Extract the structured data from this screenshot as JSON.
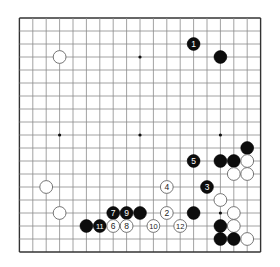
{
  "board": {
    "size": 19,
    "origin_x": 19.4,
    "origin_y": 18,
    "step_x": 13.4,
    "step_y": 13.0,
    "line_color": "#8a8a8a",
    "edge_color": "#333333",
    "star_points": [
      [
        3,
        3
      ],
      [
        9,
        3
      ],
      [
        15,
        3
      ],
      [
        3,
        9
      ],
      [
        9,
        9
      ],
      [
        15,
        9
      ],
      [
        3,
        15
      ],
      [
        9,
        15
      ],
      [
        15,
        15
      ]
    ]
  },
  "stones": [
    {
      "color": "white",
      "col": 3,
      "row": 3,
      "label": ""
    },
    {
      "color": "black",
      "col": 13,
      "row": 2,
      "label": "1"
    },
    {
      "color": "black",
      "col": 15,
      "row": 3,
      "label": ""
    },
    {
      "color": "black",
      "col": 17,
      "row": 10,
      "label": ""
    },
    {
      "color": "black",
      "col": 13,
      "row": 11,
      "label": "5"
    },
    {
      "color": "black",
      "col": 15,
      "row": 11,
      "label": ""
    },
    {
      "color": "black",
      "col": 16,
      "row": 11,
      "label": ""
    },
    {
      "color": "white",
      "col": 17,
      "row": 11,
      "label": ""
    },
    {
      "color": "white",
      "col": 16,
      "row": 12,
      "label": ""
    },
    {
      "color": "white",
      "col": 17,
      "row": 12,
      "label": ""
    },
    {
      "color": "white",
      "col": 2,
      "row": 13,
      "label": ""
    },
    {
      "color": "white",
      "col": 11,
      "row": 13,
      "label": "4"
    },
    {
      "color": "black",
      "col": 14,
      "row": 13,
      "label": "3"
    },
    {
      "color": "white",
      "col": 15,
      "row": 14,
      "label": ""
    },
    {
      "color": "white",
      "col": 3,
      "row": 15,
      "label": ""
    },
    {
      "color": "black",
      "col": 7,
      "row": 15,
      "label": "7"
    },
    {
      "color": "black",
      "col": 8,
      "row": 15,
      "label": "9"
    },
    {
      "color": "black",
      "col": 9,
      "row": 15,
      "label": ""
    },
    {
      "color": "white",
      "col": 11,
      "row": 15,
      "label": "2"
    },
    {
      "color": "black",
      "col": 13,
      "row": 15,
      "label": ""
    },
    {
      "color": "white",
      "col": 16,
      "row": 15,
      "label": ""
    },
    {
      "color": "black",
      "col": 5,
      "row": 16,
      "label": ""
    },
    {
      "color": "black",
      "col": 6,
      "row": 16,
      "label": "11"
    },
    {
      "color": "white",
      "col": 7,
      "row": 16,
      "label": "6"
    },
    {
      "color": "white",
      "col": 8,
      "row": 16,
      "label": "8"
    },
    {
      "color": "white",
      "col": 10,
      "row": 16,
      "label": "10"
    },
    {
      "color": "white",
      "col": 12,
      "row": 16,
      "label": "12"
    },
    {
      "color": "black",
      "col": 15,
      "row": 16,
      "label": ""
    },
    {
      "color": "white",
      "col": 16,
      "row": 16,
      "label": ""
    },
    {
      "color": "black",
      "col": 15,
      "row": 17,
      "label": ""
    },
    {
      "color": "black",
      "col": 16,
      "row": 17,
      "label": ""
    },
    {
      "color": "white",
      "col": 17,
      "row": 17,
      "label": ""
    }
  ]
}
